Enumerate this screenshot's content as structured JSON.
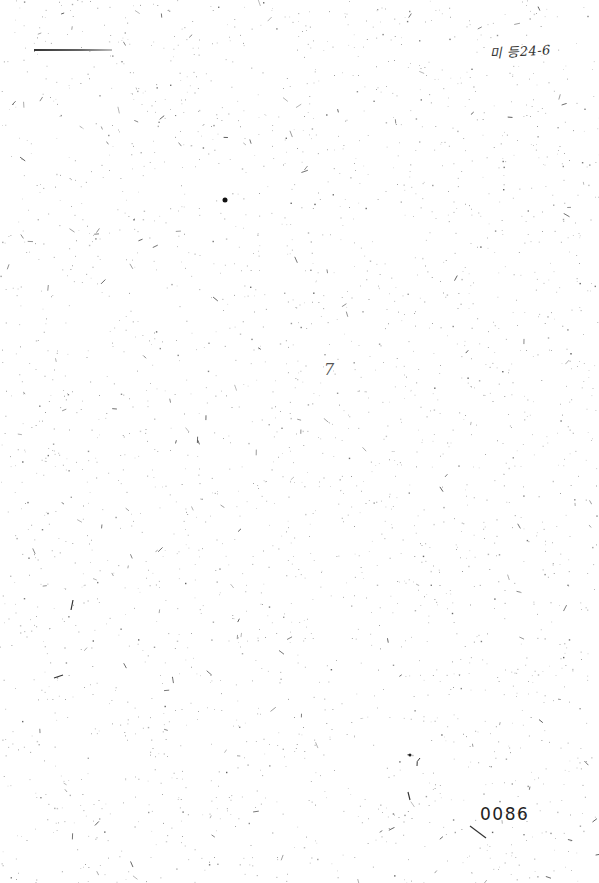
{
  "document": {
    "type": "scanned-blank-page",
    "header_annotation": "미 등24-6",
    "center_mark": "7",
    "page_number": "0086"
  }
}
